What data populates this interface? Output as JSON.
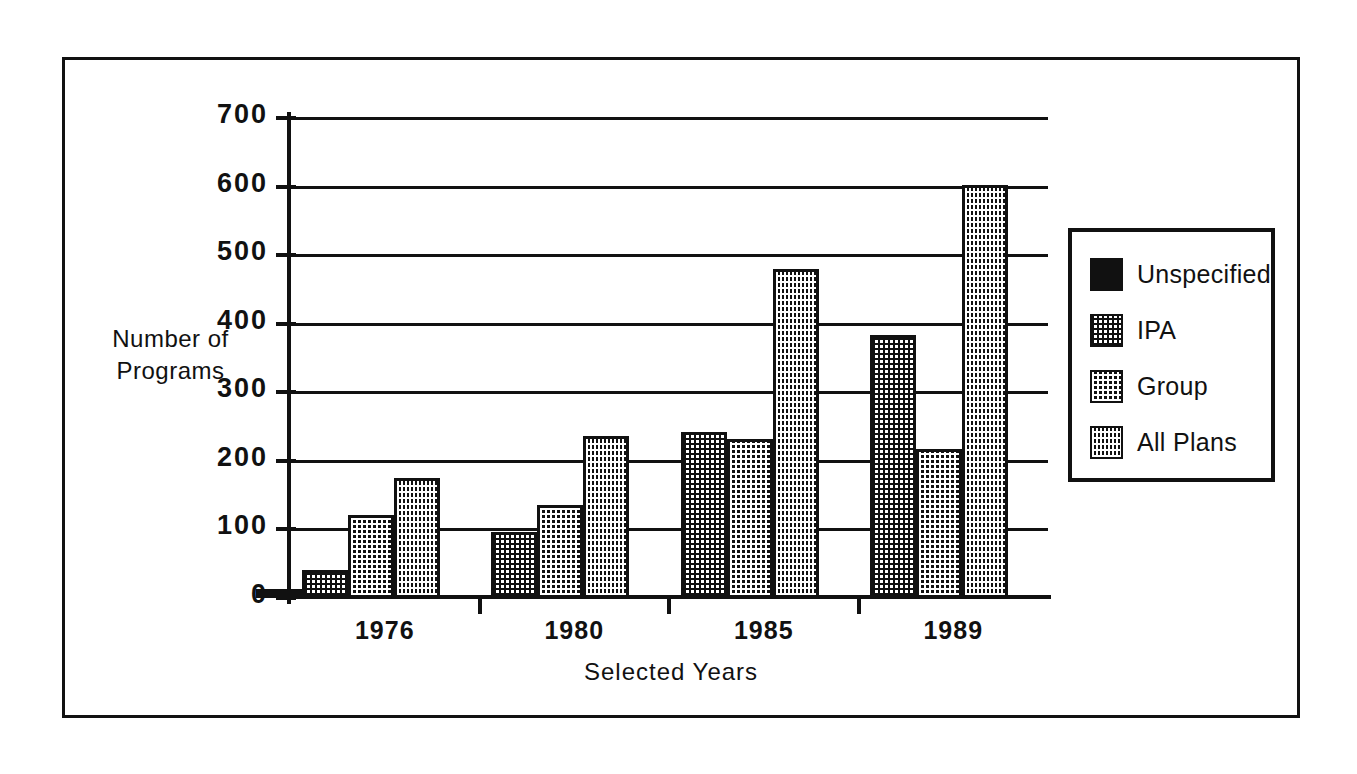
{
  "figure": {
    "background_color": "#ffffff",
    "frame_color": "#111111"
  },
  "chart_data": {
    "type": "bar",
    "title": "",
    "xlabel": "Selected Years",
    "ylabel_line1": "Number of",
    "ylabel_line2": "Programs",
    "ylabel": "Number of Programs",
    "categories": [
      "1976",
      "1980",
      "1985",
      "1989"
    ],
    "ylim": [
      0,
      700
    ],
    "yticks": [
      0,
      100,
      200,
      300,
      400,
      500,
      600,
      700
    ],
    "ytick_labels": [
      "0",
      "100",
      "200",
      "300",
      "400",
      "500",
      "600",
      "700"
    ],
    "grid": true,
    "grid_axis": "y",
    "legend_position": "right",
    "series": [
      {
        "name": "Unspecified",
        "fill": "solid",
        "color": "#111111",
        "values": [
          13,
          null,
          null,
          null
        ]
      },
      {
        "name": "IPA",
        "fill": "light-dotted",
        "color": "#c8c8c8",
        "values": [
          41,
          97,
          242,
          383
        ]
      },
      {
        "name": "Group",
        "fill": "medium-dotted",
        "color": "#6e6e6e",
        "values": [
          121,
          136,
          232,
          218
        ]
      },
      {
        "name": "All Plans",
        "fill": "dense-dotted",
        "color": "#2a2a2a",
        "values": [
          175,
          236,
          480,
          603
        ]
      }
    ]
  },
  "legend": {
    "items": [
      {
        "label": "Unspecified",
        "fill": "solid"
      },
      {
        "label": "IPA",
        "fill": "light-dotted"
      },
      {
        "label": "Group",
        "fill": "medium-dotted"
      },
      {
        "label": "All  Plans",
        "fill": "dense-dotted"
      }
    ]
  }
}
